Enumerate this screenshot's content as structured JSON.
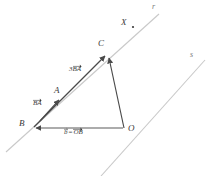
{
  "figure": {
    "type": "vector-geometry-diagram",
    "background_color": "#ffffff",
    "line_color": "#c9c9c9",
    "vector_color": "#4a4a4a",
    "label_color": "#3a3a3a",
    "lines": [
      {
        "name": "r",
        "label": "r",
        "label_x": 152,
        "label_y": 6,
        "x1": 6,
        "y1": 152,
        "x2": 159,
        "y2": 14
      },
      {
        "name": "s",
        "label": "s",
        "label_x": 190,
        "label_y": 54,
        "x1": 101,
        "y1": 176,
        "x2": 205,
        "y2": 60
      }
    ],
    "points": [
      {
        "name": "A",
        "label": "A",
        "label_x": 54,
        "label_y": 88,
        "x": 60,
        "y": 98
      },
      {
        "name": "B",
        "label": "B",
        "label_x": 20,
        "label_y": 121,
        "x": 33,
        "y": 128
      },
      {
        "name": "C",
        "label": "C",
        "label_x": 98,
        "label_y": 41,
        "x": 107,
        "y": 54
      },
      {
        "name": "O",
        "label": "O",
        "label_x": 128,
        "label_y": 126,
        "x": 124,
        "y": 128
      },
      {
        "name": "X",
        "label": "X",
        "label_x": 122,
        "label_y": 20,
        "x": 133,
        "y": 27
      }
    ],
    "vectors": [
      {
        "name": "BA",
        "label_parts": [
          {
            "text": "BA",
            "overarrow": true
          }
        ],
        "label_x": 34,
        "label_y": 103,
        "from": "B",
        "to": "A"
      },
      {
        "name": "3BA",
        "label_parts": [
          {
            "text": "3",
            "overarrow": false
          },
          {
            "text": "BA",
            "overarrow": true
          }
        ],
        "label_x": 70,
        "label_y": 69,
        "from": "B",
        "to": "C"
      },
      {
        "name": "b-equals-OB",
        "label_parts": [
          {
            "text": "b",
            "overarrow": true
          },
          {
            "text": "=",
            "overarrow": false
          },
          {
            "text": "OB",
            "overarrow": true
          }
        ],
        "label_x": 66,
        "label_y": 131,
        "from": "O",
        "to": "B"
      },
      {
        "name": "OC",
        "label_parts": [],
        "label_x": 0,
        "label_y": 0,
        "from": "O",
        "to": "C"
      }
    ]
  }
}
